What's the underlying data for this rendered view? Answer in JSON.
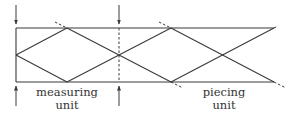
{
  "diagram": {
    "type": "strip-diagram",
    "stroke_color": "#3a3a3a",
    "labels": {
      "measuring_line1": "measuring",
      "measuring_line2": "unit",
      "piecing_line1": "piecing",
      "piecing_line2": "unit"
    },
    "geometry": {
      "top_y": 28,
      "bottom_y": 82,
      "mid_y": 55,
      "left_x": 16,
      "right_x": 274,
      "divider_x": 119
    }
  }
}
